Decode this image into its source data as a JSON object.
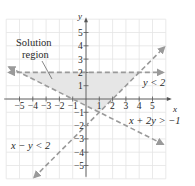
{
  "chart_data": {
    "type": "line",
    "title": "",
    "xlabel": "x",
    "ylabel": "y",
    "xlim": [
      -6,
      6
    ],
    "ylim": [
      -6,
      6
    ],
    "grid": true,
    "x_ticks": [
      -5,
      -4,
      -3,
      -2,
      -1,
      1,
      2,
      3,
      4,
      5
    ],
    "y_ticks": [
      -5,
      -4,
      -3,
      -2,
      -1,
      1,
      2,
      3,
      4,
      5
    ],
    "series": [
      {
        "name": "y < 2",
        "style": "dashed",
        "points": [
          [
            -6,
            2
          ],
          [
            6,
            2
          ]
        ],
        "label": "y < 2"
      },
      {
        "name": "x + 2y > -1",
        "style": "dashed",
        "points": [
          [
            -6,
            2.5
          ],
          [
            6,
            -3.5
          ]
        ],
        "label": "x + 2y > −1"
      },
      {
        "name": "x - y < 2",
        "style": "dashed",
        "points": [
          [
            -4,
            -6
          ],
          [
            6,
            4
          ]
        ],
        "label": "x − y < 2"
      }
    ],
    "shaded_region": {
      "name": "Solution region",
      "vertices": [
        [
          -5,
          2
        ],
        [
          4,
          2
        ],
        [
          1,
          -1
        ]
      ],
      "color": "#e6e6e6"
    },
    "annotations": [
      "Solution region",
      "y < 2",
      "x + 2y > −1",
      "x − y < 2"
    ]
  },
  "labels": {
    "x_axis": "x",
    "y_axis": "y",
    "solution_line1": "Solution",
    "solution_line2": "region",
    "ineq1": "y < 2",
    "ineq2": "x + 2y > −1",
    "ineq3": "x − y < 2"
  },
  "colors": {
    "grid": "#e4e4e4",
    "axis": "#555555",
    "dashed_line": "#9a9a9a",
    "shade": "#e6e6e6"
  }
}
